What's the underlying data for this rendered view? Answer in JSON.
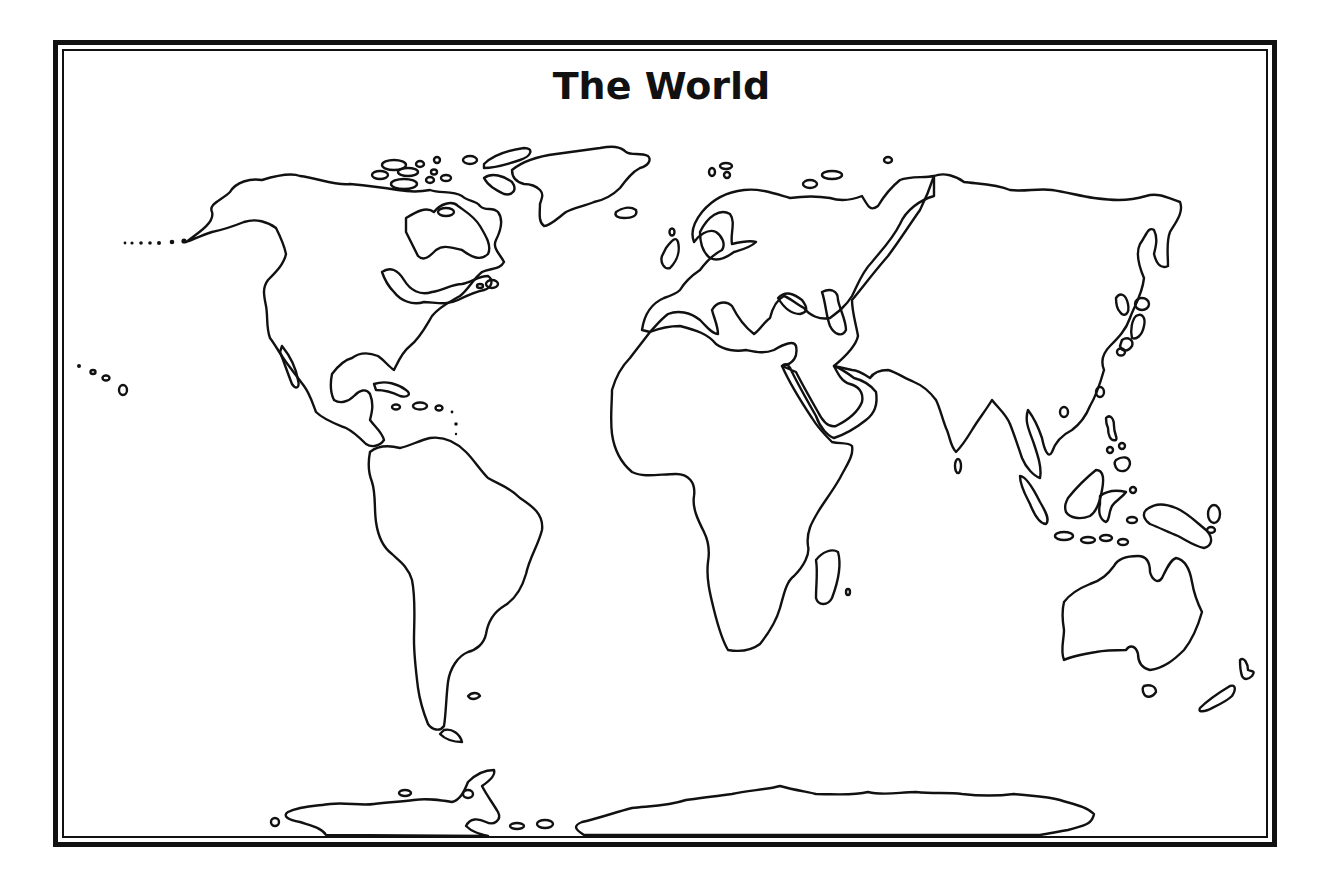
{
  "map": {
    "title": "The World",
    "style": "blank outline map",
    "colors": {
      "outline": "#111111",
      "background": "#ffffff"
    },
    "regions": [
      "North America",
      "Greenland",
      "Central America and Caribbean",
      "South America",
      "Europe",
      "Africa",
      "Madagascar",
      "Arabian Peninsula",
      "Asia",
      "Japan",
      "Southeast Asian Islands",
      "Australia",
      "New Zealand",
      "Antarctica",
      "Hawaii",
      "Aleutian Islands"
    ]
  }
}
